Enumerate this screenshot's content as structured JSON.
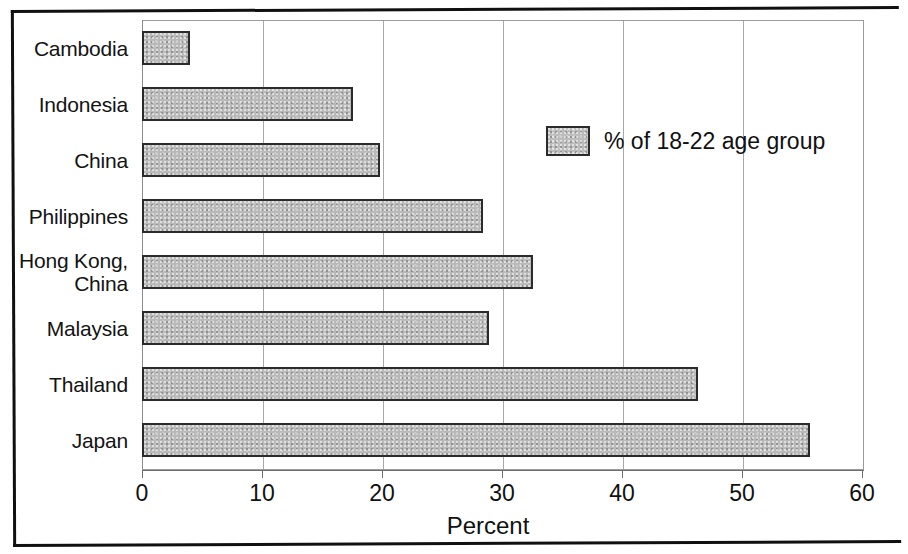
{
  "chart_data": {
    "type": "bar",
    "orientation": "horizontal",
    "title": "",
    "subtitle": "",
    "xlabel": "Percent",
    "ylabel": "",
    "categories": [
      "Cambodia",
      "Indonesia",
      "China",
      "Philippines",
      "Hong Kong, China",
      "Malaysia",
      "Thailand",
      "Japan"
    ],
    "category_lines": [
      [
        "Cambodia"
      ],
      [
        "Indonesia"
      ],
      [
        "China"
      ],
      [
        "Philippines"
      ],
      [
        "Hong Kong,",
        "China"
      ],
      [
        "Malaysia"
      ],
      [
        "Thailand"
      ],
      [
        "Japan"
      ]
    ],
    "series": [
      {
        "name": "% of 18-22 age group",
        "values": [
          4,
          17.5,
          19.8,
          28.3,
          32.5,
          28.8,
          46.2,
          55.5
        ]
      }
    ],
    "values": [
      4,
      17.5,
      19.8,
      28.3,
      32.5,
      28.8,
      46.2,
      55.5
    ],
    "xlim": [
      0,
      60
    ],
    "xticks": [
      0,
      10,
      20,
      30,
      40,
      50,
      60
    ],
    "xtick_labels": [
      "0",
      "10",
      "20",
      "30",
      "40",
      "50",
      "60"
    ],
    "grid": "vertical",
    "legend_position": "upper-right-inside",
    "colors": {
      "bar_fill": "#b9b9b9",
      "bar_border": "#2b2b2b",
      "gridline": "#a8a8a8",
      "axis": "#6f6f6f",
      "text": "#111111",
      "frame": "#101010"
    }
  },
  "legend": {
    "entries": [
      {
        "label": "% of 18-22 age group",
        "swatch": "bar-fill-gray"
      }
    ]
  },
  "axis": {
    "x_title": "Percent"
  }
}
